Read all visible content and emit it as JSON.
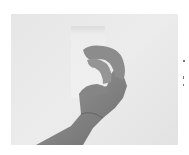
{
  "image": {
    "description": "Grayscale photograph of a hand holding a small white card against a light background",
    "colors": {
      "background": "#ffffff",
      "photo_bg": "#e8e8e8",
      "card": "#efefef",
      "hand": "#8a8a8a"
    }
  }
}
